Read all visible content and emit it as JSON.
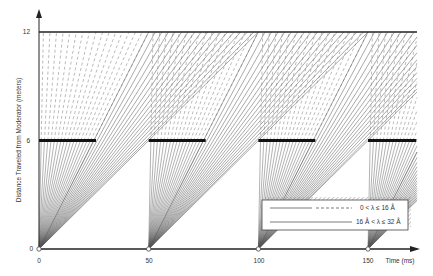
{
  "chart_data": {
    "type": "line",
    "title": "",
    "xlabel": "Time (ms)",
    "ylabel": "Distance Traveled from Moderator (meters)",
    "xlim": [
      0,
      160
    ],
    "ylim": [
      0,
      12
    ],
    "x_ticks": [
      0,
      50,
      100,
      150
    ],
    "y_ticks": [
      0,
      6,
      12
    ],
    "grid": false,
    "pulse_times_ms": [
      0,
      50,
      100,
      150
    ],
    "pulse_period_ms": 50,
    "detector_distance_m": 12,
    "chopper": {
      "distance_m": 6,
      "closed_intervals_ms": [
        [
          0,
          26
        ],
        [
          50,
          76
        ],
        [
          100,
          126
        ],
        [
          150,
          172
        ]
      ]
    },
    "series": [
      {
        "name": "0 < λ ≤ 16 Å",
        "style": "dashed",
        "description": "fast neutrons; time to reach 12 m ranges ~2–50 ms after each pulse",
        "arrival_at_12m_ms": [
          2,
          5,
          8,
          11,
          14,
          17,
          20,
          23,
          26,
          29,
          32,
          35,
          38,
          41,
          44,
          47,
          50
        ]
      },
      {
        "name": "16 Å < λ ≤ 32 Å",
        "style": "solid",
        "description": "slow neutrons; time to reach 12 m ranges ~50–100 ms after each pulse",
        "arrival_at_12m_ms": [
          50,
          53,
          56,
          59,
          62,
          65,
          68,
          71,
          74,
          77,
          80,
          83,
          86,
          89,
          92,
          95,
          98,
          100
        ]
      }
    ],
    "legend": {
      "position": "lower right",
      "entries": [
        {
          "label": "0 < λ ≤ 16 Å",
          "style": "solid-then-dashed"
        },
        {
          "label": "16 Å < λ ≤ 32 Å",
          "style": "solid"
        }
      ]
    },
    "annotations": []
  },
  "axes": {
    "x_label": "Time (ms)",
    "y_label": "Distance Traveled from Moderator (meters)",
    "x_ticks": [
      "0",
      "50",
      "100",
      "150"
    ],
    "y_ticks": [
      "0",
      "6",
      "12"
    ]
  },
  "legend": {
    "entry1": "0 < λ ≤ 16 Å",
    "entry2": "16 Å < λ ≤ 32 Å"
  },
  "colors": {
    "axis": "#333333",
    "line": "#555555",
    "chopper": "#111111",
    "background": "#ffffff"
  }
}
